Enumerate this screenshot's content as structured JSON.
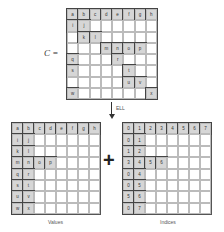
{
  "top_matrix": {
    "label": "C =",
    "rows": 8,
    "cols": 8,
    "cells": [
      [
        "a",
        "b",
        "c",
        "d",
        "e",
        "f",
        "g",
        "h"
      ],
      [
        "i",
        "j",
        "",
        "",
        "",
        "",
        "",
        ""
      ],
      [
        "",
        "k",
        "l",
        "",
        "",
        "",
        "",
        ""
      ],
      [
        "",
        "",
        "",
        "m",
        "n",
        "o",
        "p",
        ""
      ],
      [
        "q",
        "",
        "",
        "",
        "r",
        "",
        "",
        ""
      ],
      [
        "s",
        "",
        "",
        "",
        "",
        "t",
        "",
        ""
      ],
      [
        "",
        "",
        "",
        "",
        "",
        "u",
        "v",
        ""
      ],
      [
        "w",
        "",
        "",
        "",
        "",
        "",
        "",
        "x"
      ]
    ]
  },
  "transform": {
    "label": "ELL"
  },
  "operator": "+",
  "values_matrix": {
    "caption": "Values",
    "cells": [
      [
        "a",
        "b",
        "c",
        "d",
        "e",
        "f",
        "g",
        "h"
      ],
      [
        "i",
        "j",
        "",
        "",
        "",
        "",
        "",
        ""
      ],
      [
        "k",
        "l",
        "",
        "",
        "",
        "",
        "",
        ""
      ],
      [
        "m",
        "n",
        "o",
        "p",
        "",
        "",
        "",
        ""
      ],
      [
        "q",
        "r",
        "",
        "",
        "",
        "",
        "",
        ""
      ],
      [
        "s",
        "t",
        "",
        "",
        "",
        "",
        "",
        ""
      ],
      [
        "u",
        "v",
        "",
        "",
        "",
        "",
        "",
        ""
      ],
      [
        "w",
        "x",
        "",
        "",
        "",
        "",
        "",
        ""
      ]
    ]
  },
  "indices_matrix": {
    "caption": "Indices",
    "cells": [
      [
        "0",
        "1",
        "2",
        "3",
        "4",
        "5",
        "6",
        "7"
      ],
      [
        "0",
        "1",
        "",
        "",
        "",
        "",
        "",
        ""
      ],
      [
        "1",
        "2",
        "",
        "",
        "",
        "",
        "",
        ""
      ],
      [
        "3",
        "4",
        "5",
        "6",
        "",
        "",
        "",
        ""
      ],
      [
        "0",
        "4",
        "",
        "",
        "",
        "",
        "",
        ""
      ],
      [
        "0",
        "5",
        "",
        "",
        "",
        "",
        "",
        ""
      ],
      [
        "5",
        "6",
        "",
        "",
        "",
        "",
        "",
        ""
      ],
      [
        "0",
        "7",
        "",
        "",
        "",
        "",
        "",
        ""
      ]
    ]
  }
}
